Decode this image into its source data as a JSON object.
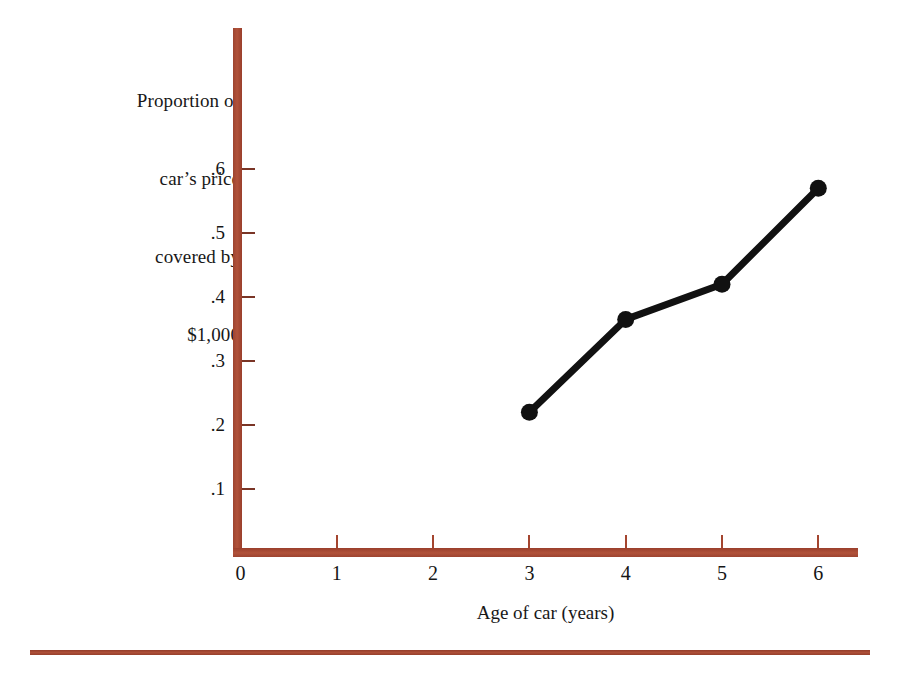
{
  "chart_data": {
    "type": "line",
    "title": "",
    "ylabel": "Proportion of car's price covered by $1,000",
    "ylabel_lines": [
      "Proportion of",
      "car’s price",
      "covered by",
      "$1,000"
    ],
    "xlabel": "Age of car (years)",
    "x": [
      3,
      4,
      5,
      6
    ],
    "values": [
      0.22,
      0.365,
      0.42,
      0.57
    ],
    "series": [
      {
        "name": "Proportion of car's price covered by $1,000",
        "x": [
          3,
          4,
          5,
          6
        ],
        "values": [
          0.22,
          0.365,
          0.42,
          0.57
        ]
      }
    ],
    "xlim": [
      0,
      6.5
    ],
    "ylim": [
      0,
      0.65
    ],
    "xticks": [
      0,
      1,
      2,
      3,
      4,
      5,
      6
    ],
    "xtick_labels": [
      "0",
      "1",
      "2",
      "3",
      "4",
      "5",
      "6"
    ],
    "yticks": [
      0.1,
      0.2,
      0.3,
      0.4,
      0.5,
      0.6
    ],
    "ytick_labels": [
      ".1",
      ".2",
      ".3",
      ".4",
      ".5",
      ".6"
    ],
    "grid": false,
    "legend": "none",
    "marker": "filled-circle",
    "line_color": "#111111",
    "marker_color": "#111111",
    "axis_color": "#a8472f",
    "rule_color": "#a8472f"
  },
  "colors": {
    "axis": "#a8472f",
    "line": "#111111",
    "text": "#181818",
    "background": "#ffffff"
  }
}
